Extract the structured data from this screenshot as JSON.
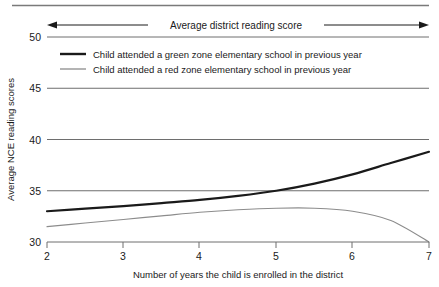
{
  "chart_data": {
    "type": "line",
    "title": "",
    "xlabel": "Number of years the child is enrolled in the district",
    "ylabel": "Average NCE reading scores",
    "xlim": [
      2,
      7
    ],
    "ylim": [
      30,
      50
    ],
    "xticks": [
      2,
      3,
      4,
      5,
      6,
      7
    ],
    "yticks": [
      30,
      35,
      40,
      45,
      50
    ],
    "xtick_labels": [
      "2",
      "3",
      "4",
      "5",
      "6",
      "7"
    ],
    "ytick_labels": [
      "30",
      "35",
      "40",
      "45",
      "50"
    ],
    "grid": true,
    "grid_axis": "y",
    "legend_position": "upper-left-inside",
    "series": [
      {
        "name": "Child attended a green zone elementary school in previous year",
        "color": "#1a1a1a",
        "width": 2.2,
        "x": [
          2.0,
          2.5,
          3.0,
          3.5,
          4.0,
          4.5,
          5.0,
          5.5,
          6.0,
          6.5,
          7.0
        ],
        "values": [
          33.0,
          33.25,
          33.5,
          33.8,
          34.1,
          34.5,
          35.0,
          35.7,
          36.6,
          37.7,
          38.8
        ]
      },
      {
        "name": "Child attended a red zone elementary school in previous year",
        "color": "#8c8c8c",
        "width": 1.1,
        "x": [
          2.0,
          2.5,
          3.0,
          3.5,
          4.0,
          4.5,
          5.0,
          5.5,
          6.0,
          6.5,
          7.0
        ],
        "values": [
          31.5,
          31.85,
          32.2,
          32.55,
          32.9,
          33.15,
          33.3,
          33.3,
          33.0,
          32.1,
          30.0
        ]
      }
    ],
    "annotations": [
      {
        "name": "average-district-reading-score",
        "text": "Average district reading score",
        "type": "double-arrow",
        "y_value": 50,
        "x_from": 2,
        "x_to": 7
      }
    ]
  },
  "legend": {
    "items": [
      {
        "label": "Child attended a green zone elementary school in previous year"
      },
      {
        "label": "Child attended a red zone elementary school in previous year"
      }
    ]
  },
  "colors": {
    "green_zone_line": "#1a1a1a",
    "red_zone_line": "#8c8c8c",
    "gridline": "#6e6e6e",
    "axis": "#6e6e6e",
    "top_rule": "#7a7a7a",
    "background": "#ffffff"
  }
}
